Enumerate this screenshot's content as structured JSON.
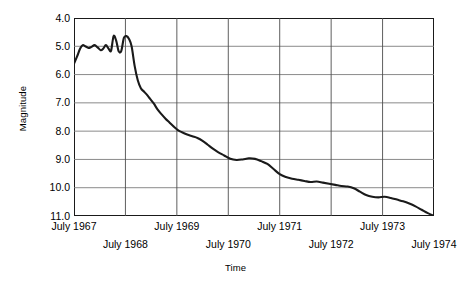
{
  "chart_data": {
    "type": "line",
    "title": "",
    "xlabel": "Time",
    "ylabel": "Magnitude",
    "ylim": [
      4.0,
      11.0
    ],
    "y_inverted": true,
    "grid": true,
    "legend": "none",
    "y_ticks": [
      "4.0",
      "5.0",
      "6.0",
      "7.0",
      "8.0",
      "9.0",
      "10.0",
      "11.0"
    ],
    "y_tick_values": [
      4.0,
      5.0,
      6.0,
      7.0,
      8.0,
      9.0,
      10.0,
      11.0
    ],
    "x_ticks": [
      "July 1967",
      "July 1968",
      "July 1969",
      "July 1970",
      "July 1971",
      "July 1972",
      "July 1973",
      "July 1974"
    ],
    "x_tick_values": [
      1967.5,
      1968.5,
      1969.5,
      1970.5,
      1971.5,
      1972.5,
      1973.5,
      1974.5
    ],
    "xlim": [
      1967.5,
      1974.5
    ],
    "series": [
      {
        "name": "Magnitude",
        "color": "#1a1a1a",
        "x": [
          1967.5,
          1967.56,
          1967.62,
          1967.67,
          1967.72,
          1967.78,
          1967.84,
          1967.9,
          1967.96,
          1968.02,
          1968.07,
          1968.12,
          1968.17,
          1968.22,
          1968.27,
          1968.32,
          1968.37,
          1968.42,
          1968.47,
          1968.52,
          1968.57,
          1968.62,
          1968.68,
          1968.74,
          1968.8,
          1968.86,
          1968.92,
          1968.98,
          1969.05,
          1969.12,
          1969.2,
          1969.28,
          1969.36,
          1969.44,
          1969.52,
          1969.6,
          1969.7,
          1969.8,
          1969.9,
          1970.0,
          1970.1,
          1970.2,
          1970.3,
          1970.42,
          1970.54,
          1970.66,
          1970.78,
          1970.9,
          1971.02,
          1971.14,
          1971.26,
          1971.38,
          1971.5,
          1971.62,
          1971.74,
          1971.86,
          1971.98,
          1972.1,
          1972.22,
          1972.34,
          1972.46,
          1972.58,
          1972.7,
          1972.82,
          1972.94,
          1973.06,
          1973.18,
          1973.3,
          1973.42,
          1973.54,
          1973.66,
          1973.78,
          1973.9,
          1974.02,
          1974.14,
          1974.26,
          1974.38,
          1974.5
        ],
        "y": [
          5.62,
          5.36,
          5.08,
          4.96,
          5.0,
          5.06,
          5.02,
          4.96,
          5.04,
          5.14,
          5.08,
          4.96,
          5.08,
          5.16,
          4.64,
          4.8,
          5.18,
          5.16,
          4.7,
          4.64,
          4.74,
          5.0,
          5.7,
          6.2,
          6.48,
          6.6,
          6.72,
          6.86,
          7.02,
          7.22,
          7.4,
          7.56,
          7.7,
          7.84,
          7.96,
          8.04,
          8.12,
          8.18,
          8.24,
          8.34,
          8.48,
          8.62,
          8.74,
          8.86,
          8.98,
          9.02,
          9.0,
          8.96,
          8.98,
          9.06,
          9.16,
          9.34,
          9.52,
          9.62,
          9.68,
          9.72,
          9.76,
          9.8,
          9.78,
          9.82,
          9.86,
          9.9,
          9.94,
          9.96,
          10.02,
          10.14,
          10.26,
          10.32,
          10.34,
          10.32,
          10.36,
          10.42,
          10.48,
          10.56,
          10.66,
          10.78,
          10.9,
          11.0
        ]
      }
    ],
    "annotations": []
  }
}
